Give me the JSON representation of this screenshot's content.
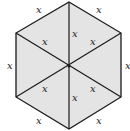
{
  "diagram": {
    "shape": "regular hexagon divided into 6 equilateral triangles",
    "fill_color": "#e4e4e4",
    "stroke_color": "#1a1a1a",
    "side_label": "x",
    "labels": {
      "outer_top_left": "x",
      "outer_top_right": "x",
      "outer_left": "x",
      "outer_right": "x",
      "outer_bottom_left": "x",
      "outer_bottom_right": "x",
      "inner_top": "x",
      "inner_upper_left": "x",
      "inner_upper_right": "x",
      "inner_lower_left": "x",
      "inner_lower_right": "x",
      "inner_bottom": "x"
    }
  }
}
